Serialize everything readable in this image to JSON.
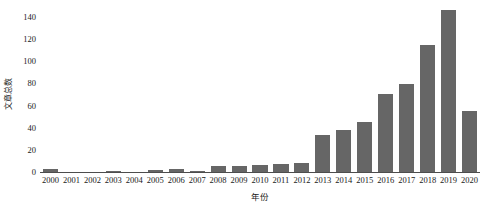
{
  "chart_data": {
    "type": "bar",
    "title": "",
    "xlabel": "年份",
    "ylabel": "文章总数",
    "categories": [
      "2000",
      "2001",
      "2002",
      "2003",
      "2004",
      "2005",
      "2006",
      "2007",
      "2008",
      "2009",
      "2010",
      "2011",
      "2012",
      "2013",
      "2014",
      "2015",
      "2016",
      "2017",
      "2018",
      "2019",
      "2020"
    ],
    "values": [
      3,
      0,
      0,
      1,
      0,
      2,
      3,
      1,
      5,
      5,
      6,
      7,
      8,
      33,
      38,
      45,
      70,
      79,
      115,
      146,
      55
    ],
    "ylim": [
      0,
      148
    ],
    "yticks": [
      0,
      20,
      40,
      60,
      80,
      100,
      120,
      140
    ],
    "ytick_labels": [
      "0",
      "20",
      "40",
      "60",
      "80",
      "100",
      "120",
      "140"
    ],
    "grid": false,
    "legend": "none",
    "bar_color": "#666666",
    "axis_color": "#4d4d4d",
    "text_color": "#1a1a1a",
    "background": "#ffffff"
  }
}
